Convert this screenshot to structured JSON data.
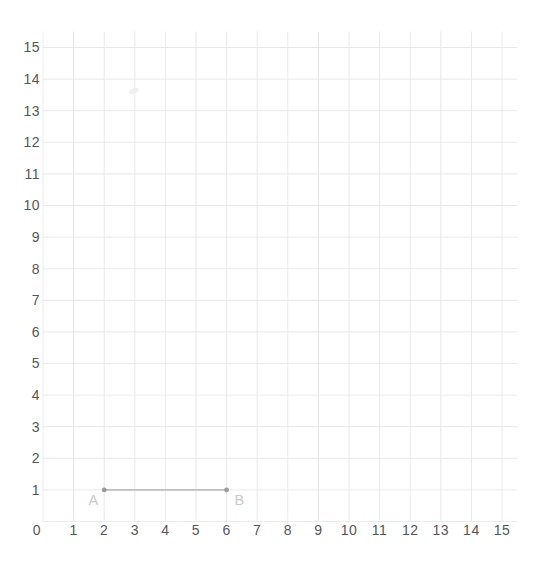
{
  "chart_data": {
    "type": "scatter",
    "title": "",
    "xlabel": "",
    "ylabel": "",
    "xlim": [
      0,
      15
    ],
    "ylim": [
      0,
      15
    ],
    "grid": true,
    "legend": "none",
    "x_ticks": [
      0,
      1,
      2,
      3,
      4,
      5,
      6,
      7,
      8,
      9,
      10,
      11,
      12,
      13,
      14,
      15
    ],
    "y_ticks": [
      1,
      2,
      3,
      4,
      5,
      6,
      7,
      8,
      9,
      10,
      11,
      12,
      13,
      14,
      15
    ],
    "points": [
      {
        "label": "A",
        "x": 2,
        "y": 1
      },
      {
        "label": "B",
        "x": 6,
        "y": 1
      }
    ],
    "segments": [
      {
        "from": "A",
        "to": "B",
        "x1": 2,
        "y1": 1,
        "x2": 6,
        "y2": 1
      }
    ],
    "colors": {
      "background": "#ffffff",
      "grid_line": "#e6e5e8",
      "tick_label": "#55565b",
      "point": "#9b9ba1",
      "segment": "#bdbdc2",
      "point_label": "#c9c9ce",
      "smudge": "#efeef1"
    }
  }
}
